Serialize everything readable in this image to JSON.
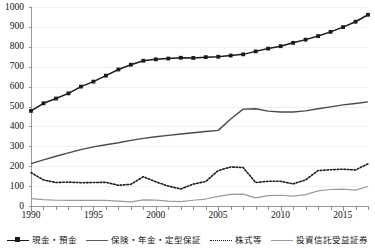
{
  "chart_data": {
    "type": "line",
    "title": "",
    "xlabel": "",
    "ylabel": "",
    "ylim": [
      0,
      1000
    ],
    "ytick_step": 100,
    "yticks": [
      "0",
      "100",
      "200",
      "300",
      "400",
      "500",
      "600",
      "700",
      "800",
      "900",
      "1000"
    ],
    "xlim": [
      1990,
      2017
    ],
    "xticks_labeled": [
      "1990",
      "1995",
      "2000",
      "2005",
      "2010",
      "2015"
    ],
    "x": [
      1990,
      1991,
      1992,
      1993,
      1994,
      1995,
      1996,
      1997,
      1998,
      1999,
      2000,
      2001,
      2002,
      2003,
      2004,
      2005,
      2006,
      2007,
      2008,
      2009,
      2010,
      2011,
      2012,
      2013,
      2014,
      2015,
      2016,
      2017
    ],
    "grid": true,
    "legend_position": "bottom",
    "series": [
      {
        "name": "現金・預金",
        "style": "solid-with-markers",
        "color": "#1a1a1a",
        "values": [
          478,
          516,
          540,
          566,
          600,
          625,
          655,
          686,
          710,
          730,
          737,
          741,
          745,
          744,
          748,
          750,
          756,
          762,
          777,
          791,
          803,
          820,
          836,
          854,
          875,
          899,
          926,
          961
        ]
      },
      {
        "name": "保険・年金・定型保証",
        "style": "solid",
        "color": "#4a4a4a",
        "values": [
          213,
          232,
          250,
          267,
          283,
          297,
          308,
          318,
          330,
          340,
          348,
          355,
          362,
          368,
          374,
          380,
          437,
          487,
          489,
          477,
          472,
          472,
          478,
          489,
          498,
          508,
          515,
          523
        ]
      },
      {
        "name": "株式等",
        "style": "dotted",
        "color": "#1a1a1a",
        "values": [
          168,
          131,
          118,
          120,
          117,
          118,
          119,
          104,
          109,
          147,
          122,
          100,
          86,
          110,
          123,
          178,
          196,
          193,
          118,
          124,
          124,
          111,
          131,
          178,
          182,
          185,
          181,
          212
        ]
      },
      {
        "name": "投資信託受益証券",
        "style": "solid-light",
        "color": "#9b9b9b",
        "values": [
          37,
          32,
          29,
          28,
          28,
          29,
          28,
          24,
          21,
          31,
          30,
          25,
          22,
          29,
          35,
          48,
          58,
          60,
          41,
          52,
          54,
          50,
          57,
          76,
          83,
          85,
          80,
          98
        ]
      }
    ]
  },
  "axis": {
    "y": {
      "t1000": "1000",
      "t900": "900",
      "t800": "800",
      "t700": "700",
      "t600": "600",
      "t500": "500",
      "t400": "400",
      "t300": "300",
      "t200": "200",
      "t100": "100",
      "t0": "0"
    },
    "x": {
      "x1990": "1990",
      "x1995": "1995",
      "x2000": "2000",
      "x2005": "2005",
      "x2010": "2010",
      "x2015": "2015"
    }
  },
  "legend": {
    "items": [
      {
        "label": "現金・預金"
      },
      {
        "label": "保険・年金・定型保証"
      },
      {
        "label": "株式等"
      },
      {
        "label": "投資信託受益証券"
      }
    ]
  }
}
